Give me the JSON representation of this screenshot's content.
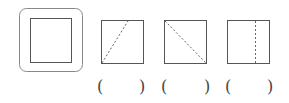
{
  "diagram": {
    "reference": {
      "shape": "square-in-rounded-frame"
    },
    "options": [
      {
        "fold": "dashed line from bottom-left corner to top edge",
        "answer": ""
      },
      {
        "fold": "dashed diagonal from top-left to bottom-right",
        "answer": ""
      },
      {
        "fold": "dashed vertical line near right side",
        "answer": ""
      }
    ],
    "answer_brackets": [
      {
        "open": "(",
        "close": ")"
      },
      {
        "open": "(",
        "close": ")"
      },
      {
        "open": "(",
        "close": ")"
      }
    ],
    "colors": {
      "stroke": "#555555",
      "frame": "#888888"
    }
  }
}
